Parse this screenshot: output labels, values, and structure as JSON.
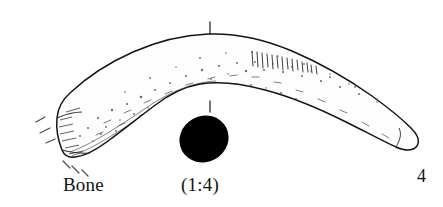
{
  "figure": {
    "domain_kind": "archaeological-line-drawing",
    "background_color": "#ffffff",
    "ink_color": "#141414",
    "section_fill_color": "#000000"
  },
  "labels": {
    "material": "Bone",
    "scale": "(1:4)",
    "figure_number": "4"
  },
  "drawing": {
    "outline_name": "bone-outline",
    "section_name": "cross-section-solid",
    "tick_top_name": "section-tick-top",
    "tick_bottom_name": "section-tick-bottom",
    "break_marks_name": "break-indicator-dashes",
    "stipple_name": "surface-stipple-texture",
    "hatch_name": "tool-mark-hatching"
  }
}
